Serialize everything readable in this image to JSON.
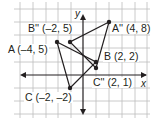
{
  "diagram": {
    "type": "coordinate-plane-transformation",
    "axes": {
      "x_label": "x",
      "y_label": "y"
    },
    "grid": {
      "unit_px": 6.45,
      "origin_px": [
        83,
        75
      ],
      "grid_every": 2
    },
    "colors": {
      "grid": "#b9b9b9",
      "axis": "#231f20",
      "line": "#231f20",
      "point": "#231f20",
      "label_bg": "#ffffff"
    },
    "triangle_original": {
      "vertices": [
        {
          "name": "A",
          "x": -4,
          "y": 5,
          "label": "A (–4, 5)"
        },
        {
          "name": "B",
          "x": 2,
          "y": 2,
          "label": "B (2, 2)"
        },
        {
          "name": "C",
          "x": -2,
          "y": -2,
          "label": "C (–2, –2)"
        }
      ]
    },
    "triangle_image": {
      "vertices": [
        {
          "name": "A''",
          "x": 4,
          "y": 8,
          "label": "A'' (4, 8)"
        },
        {
          "name": "B''",
          "x": -2,
          "y": 5,
          "label": "B'' (–2, 5)"
        },
        {
          "name": "C''",
          "x": 2,
          "y": 1,
          "label": "C'' (2, 1)"
        }
      ]
    }
  }
}
